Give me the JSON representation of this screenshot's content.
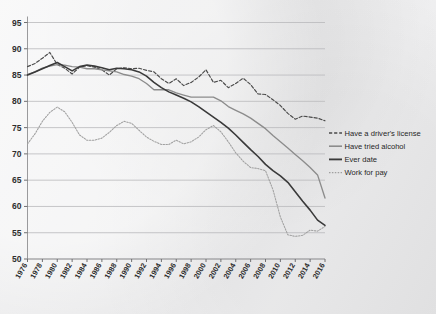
{
  "chart_data": {
    "type": "line",
    "title": "",
    "subtitle": "",
    "xlabel": "",
    "ylabel": "",
    "xlim": [
      1976,
      2016
    ],
    "ylim": [
      50,
      95
    ],
    "grid": "horizontal",
    "legend_position": "right",
    "x_ticks": [
      "1976",
      "1978",
      "1980",
      "1982",
      "1984",
      "1986",
      "1988",
      "1990",
      "1992",
      "1994",
      "1996",
      "1998",
      "2000",
      "2002",
      "2004",
      "2006",
      "2008",
      "2010",
      "2012",
      "2014",
      "2016"
    ],
    "y_ticks": [
      "50",
      "55",
      "60",
      "65",
      "70",
      "75",
      "80",
      "85",
      "90",
      "95"
    ],
    "x": [
      1976,
      1977,
      1978,
      1979,
      1980,
      1981,
      1982,
      1983,
      1984,
      1985,
      1986,
      1987,
      1988,
      1989,
      1990,
      1991,
      1992,
      1993,
      1994,
      1995,
      1996,
      1997,
      1998,
      1999,
      2000,
      2001,
      2002,
      2003,
      2004,
      2005,
      2006,
      2007,
      2008,
      2009,
      2010,
      2011,
      2012,
      2013,
      2014,
      2015,
      2016
    ],
    "series": [
      {
        "name": "Have a driver's license",
        "style": "dashed",
        "color": "#4a4a4a",
        "values": [
          86.6,
          87.2,
          88.2,
          89.3,
          87.0,
          86.3,
          85.2,
          86.5,
          86.8,
          86.5,
          86.0,
          85.0,
          86.2,
          86.4,
          86.2,
          86.3,
          85.9,
          85.6,
          84.3,
          83.4,
          84.3,
          83.0,
          83.6,
          84.6,
          86.0,
          83.6,
          84.0,
          82.6,
          83.4,
          84.4,
          83.2,
          81.4,
          81.3,
          80.3,
          79.2,
          77.7,
          76.6,
          77.2,
          77.0,
          76.8,
          76.3
        ]
      },
      {
        "name": "Have tried alcohol",
        "style": "solid-gray",
        "color": "#8c8c8c",
        "values": [
          85.1,
          85.6,
          86.3,
          86.7,
          87.0,
          86.9,
          86.6,
          86.5,
          86.2,
          86.2,
          86.0,
          85.8,
          85.6,
          85.1,
          84.8,
          84.3,
          83.4,
          82.2,
          82.2,
          82.2,
          81.6,
          81.2,
          80.8,
          80.8,
          80.8,
          80.8,
          80.1,
          79.0,
          78.3,
          77.6,
          76.8,
          75.8,
          74.8,
          73.5,
          72.3,
          71.1,
          69.9,
          68.7,
          67.4,
          66.0,
          61.6
        ]
      },
      {
        "name": "Ever date",
        "style": "solid-dark",
        "color": "#3a3a3a",
        "values": [
          85.0,
          85.6,
          86.2,
          86.8,
          87.4,
          86.6,
          85.8,
          86.6,
          86.9,
          86.7,
          86.4,
          86.0,
          86.3,
          86.2,
          86.0,
          85.6,
          84.8,
          83.6,
          82.6,
          81.8,
          81.2,
          80.6,
          79.9,
          79.0,
          78.0,
          77.0,
          76.0,
          74.9,
          73.6,
          72.2,
          70.8,
          69.5,
          68.0,
          66.8,
          65.8,
          64.6,
          62.8,
          61.0,
          59.3,
          57.4,
          56.4
        ]
      },
      {
        "name": "Work for pay",
        "style": "dotted",
        "color": "#a0a0a0",
        "values": [
          71.9,
          73.8,
          76.2,
          77.9,
          78.9,
          78.0,
          76.0,
          73.6,
          72.6,
          72.6,
          73.0,
          74.1,
          75.4,
          76.2,
          75.8,
          74.5,
          73.2,
          72.4,
          71.8,
          71.8,
          72.6,
          71.9,
          72.3,
          73.2,
          74.6,
          75.4,
          74.2,
          72.3,
          70.2,
          68.6,
          67.4,
          67.2,
          66.8,
          63.2,
          58.0,
          54.6,
          54.3,
          54.5,
          55.5,
          55.3,
          56.2
        ]
      }
    ]
  },
  "legend": {
    "items": [
      {
        "label": "Have a driver's license"
      },
      {
        "label": "Have tried alcohol"
      },
      {
        "label": "Ever date"
      },
      {
        "label": "Work for pay"
      }
    ]
  }
}
